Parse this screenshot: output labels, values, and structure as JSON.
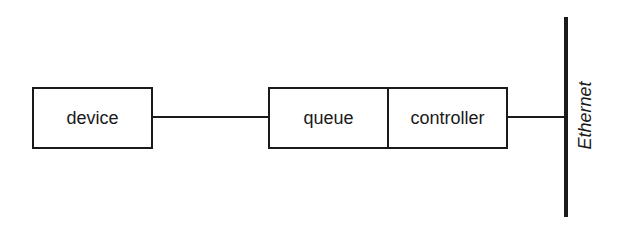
{
  "diagram": {
    "type": "block-diagram",
    "nodes": [
      {
        "id": "device",
        "label": "device"
      },
      {
        "id": "queue",
        "label": "queue"
      },
      {
        "id": "controller",
        "label": "controller"
      }
    ],
    "bus": {
      "id": "ethernet",
      "label": "Ethernet"
    },
    "edges": [
      {
        "from": "device",
        "to": "queue"
      },
      {
        "from": "controller",
        "to": "ethernet"
      }
    ],
    "colors": {
      "stroke": "#1a1a1a",
      "background": "#ffffff"
    }
  }
}
